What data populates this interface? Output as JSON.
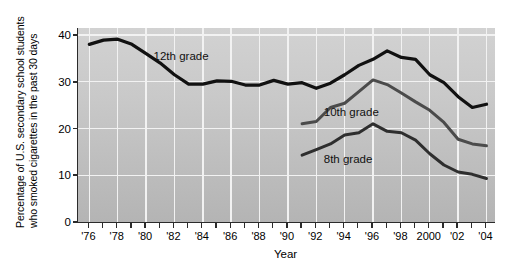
{
  "chart_data": {
    "type": "line",
    "title": "",
    "xlabel": "Year",
    "ylabel": "Percentage of U.S. secondary school students who smoked cigarettes in the past 30 days",
    "ylabel_line1": "Percentage of U.S. secondary school students",
    "ylabel_line2": "who smoked cigarettes in the past 30 days",
    "grid": true,
    "legend_position": "inline-annotations",
    "xlim": [
      1975.2,
      2004.6
    ],
    "ylim": [
      0,
      41.5
    ],
    "yticks": [
      0,
      10,
      20,
      30,
      40
    ],
    "ytick_labels": [
      "0",
      "10",
      "20",
      "30",
      "40"
    ],
    "xticks": [
      1976,
      1977,
      1978,
      1979,
      1980,
      1981,
      1982,
      1983,
      1984,
      1985,
      1986,
      1987,
      1988,
      1989,
      1990,
      1991,
      1992,
      1993,
      1994,
      1995,
      1996,
      1997,
      1998,
      1999,
      2000,
      2001,
      2002,
      2003,
      2004
    ],
    "xtick_labels": [
      {
        "x": 1976,
        "label": "'76"
      },
      {
        "x": 1978,
        "label": "'78"
      },
      {
        "x": 1980,
        "label": "'80"
      },
      {
        "x": 1982,
        "label": "'82"
      },
      {
        "x": 1984,
        "label": "'84"
      },
      {
        "x": 1986,
        "label": "'86"
      },
      {
        "x": 1988,
        "label": "'88"
      },
      {
        "x": 1990,
        "label": "'90"
      },
      {
        "x": 1992,
        "label": "'92"
      },
      {
        "x": 1994,
        "label": "'94"
      },
      {
        "x": 1996,
        "label": "'96"
      },
      {
        "x": 1998,
        "label": "'98"
      },
      {
        "x": 2000,
        "label": "2000"
      },
      {
        "x": 2002,
        "label": "'02"
      },
      {
        "x": 2004,
        "label": "'04"
      }
    ],
    "series": [
      {
        "name": "12th grade",
        "color": "#111111",
        "width": 3.2,
        "label_x": 1980.6,
        "label_y": 35.2,
        "x": [
          1976,
          1977,
          1978,
          1979,
          1980,
          1981,
          1982,
          1983,
          1984,
          1985,
          1986,
          1987,
          1988,
          1989,
          1990,
          1991,
          1992,
          1993,
          1994,
          1995,
          1996,
          1997,
          1998,
          1999,
          2000,
          2001,
          2002,
          2003,
          2004
        ],
        "values": [
          38.0,
          38.9,
          39.1,
          38.0,
          36.0,
          34.0,
          31.5,
          29.5,
          29.5,
          30.2,
          30.1,
          29.3,
          29.3,
          30.3,
          29.5,
          29.8,
          28.6,
          29.7,
          31.5,
          33.5,
          34.8,
          36.6,
          35.2,
          34.8,
          31.5,
          29.8,
          26.8,
          24.5,
          25.2
        ]
      },
      {
        "name": "10th grade",
        "color": "#4b4b4b",
        "width": 3.0,
        "label_x": 1992.6,
        "label_y": 23.3,
        "x": [
          1991,
          1992,
          1993,
          1994,
          1995,
          1996,
          1997,
          1998,
          1999,
          2000,
          2001,
          2002,
          2003,
          2004
        ],
        "values": [
          21.0,
          21.5,
          24.5,
          25.4,
          27.9,
          30.4,
          29.4,
          27.6,
          25.7,
          23.9,
          21.3,
          17.7,
          16.7,
          16.3
        ]
      },
      {
        "name": "8th grade",
        "color": "#2e2e2e",
        "width": 3.0,
        "label_x": 1992.6,
        "label_y": 13.2,
        "x": [
          1991,
          1992,
          1993,
          1994,
          1995,
          1996,
          1997,
          1998,
          1999,
          2000,
          2001,
          2002,
          2003,
          2004
        ],
        "values": [
          14.3,
          15.5,
          16.7,
          18.6,
          19.1,
          21.0,
          19.4,
          19.1,
          17.5,
          14.6,
          12.2,
          10.7,
          10.2,
          9.3
        ]
      }
    ]
  }
}
